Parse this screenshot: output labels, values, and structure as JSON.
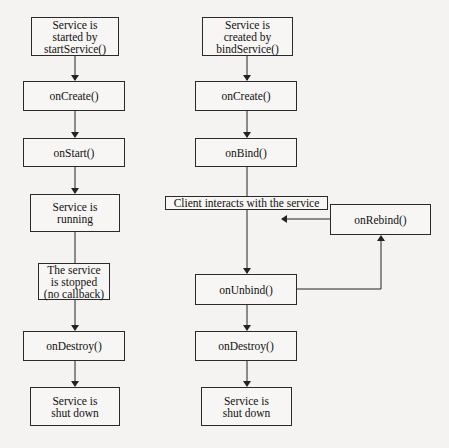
{
  "diagram": {
    "left_flow": {
      "nodes": [
        {
          "id": "start",
          "label": "Service is\nstarted by\nstartService()"
        },
        {
          "id": "oncreate",
          "label": "onCreate()"
        },
        {
          "id": "onstart",
          "label": "onStart()"
        },
        {
          "id": "running",
          "label": "Service is\nrunning"
        },
        {
          "id": "stopped",
          "label": "The service\nis stopped\n(no callback)"
        },
        {
          "id": "ondestroy",
          "label": "onDestroy()"
        },
        {
          "id": "shutdown",
          "label": "Service is\nshut down"
        }
      ]
    },
    "right_flow": {
      "nodes": [
        {
          "id": "created",
          "label": "Service is\ncreated by\nbindService()"
        },
        {
          "id": "oncreate",
          "label": "onCreate()"
        },
        {
          "id": "onbind",
          "label": "onBind()"
        },
        {
          "id": "client",
          "label": "Client interacts with the service"
        },
        {
          "id": "onunbind",
          "label": "onUnbind()"
        },
        {
          "id": "ondestroy",
          "label": "onDestroy()"
        },
        {
          "id": "shutdown",
          "label": "Service is\nshut down"
        },
        {
          "id": "onrebind",
          "label": "onRebind()"
        }
      ]
    },
    "edges": [
      {
        "from": "left.start",
        "to": "left.oncreate"
      },
      {
        "from": "left.oncreate",
        "to": "left.onstart"
      },
      {
        "from": "left.onstart",
        "to": "left.running"
      },
      {
        "from": "left.running",
        "to": "left.stopped"
      },
      {
        "from": "left.stopped",
        "to": "left.ondestroy"
      },
      {
        "from": "left.ondestroy",
        "to": "left.shutdown"
      },
      {
        "from": "right.created",
        "to": "right.oncreate"
      },
      {
        "from": "right.oncreate",
        "to": "right.onbind"
      },
      {
        "from": "right.onbind",
        "to": "right.onunbind"
      },
      {
        "from": "right.onunbind",
        "to": "right.onrebind"
      },
      {
        "from": "right.onrebind",
        "to": "right.client"
      },
      {
        "from": "right.onunbind",
        "to": "right.ondestroy"
      },
      {
        "from": "right.ondestroy",
        "to": "right.shutdown"
      }
    ]
  }
}
